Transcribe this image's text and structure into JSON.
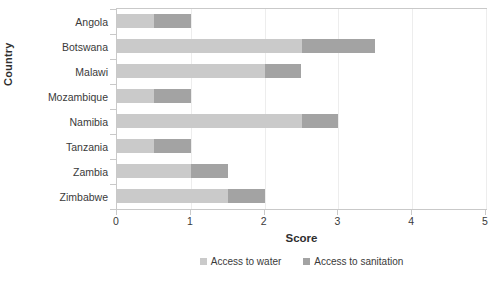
{
  "chart_data": {
    "type": "bar",
    "orientation": "horizontal",
    "stacked": true,
    "title": "",
    "xlabel": "Score",
    "ylabel": "Country",
    "xlim": [
      0,
      5
    ],
    "xticks": [
      0,
      1,
      2,
      3,
      4,
      5
    ],
    "xtick_labels": [
      "0",
      "1",
      "2",
      "3",
      "4",
      "5"
    ],
    "grid": true,
    "legend_position": "bottom",
    "categories": [
      "Angola",
      "Botswana",
      "Malawi",
      "Mozambique",
      "Namibia",
      "Tanzania",
      "Zambia",
      "Zimbabwe"
    ],
    "series": [
      {
        "name": "Access to water",
        "color": "#cacaca",
        "values": [
          0.5,
          2.5,
          2.0,
          0.5,
          2.5,
          0.5,
          1.0,
          1.5
        ]
      },
      {
        "name": "Access to sanitation",
        "color": "#a3a3a3",
        "values": [
          0.5,
          1.0,
          0.5,
          0.5,
          0.5,
          0.5,
          0.5,
          0.5
        ]
      }
    ],
    "totals": [
      1.0,
      3.5,
      2.5,
      1.0,
      3.0,
      1.0,
      1.5,
      2.0
    ]
  },
  "colors": {
    "water": "#cacaca",
    "sanitation": "#a3a3a3",
    "axis": "#c9c9c9",
    "grid": "#ededed",
    "text": "#3a3a3a"
  }
}
